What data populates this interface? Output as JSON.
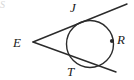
{
  "figure": {
    "kind": "geometry-diagram",
    "width": 134,
    "height": 80,
    "background_color": "#ffffff",
    "stroke_color": "#2b2b2b",
    "label_color": "#1a1a1a",
    "corner_mark": "S",
    "labels": {
      "external_point": "E",
      "upper_tangent_point": "J",
      "lower_tangent_point": "T",
      "circle_point": "R"
    },
    "geometry": {
      "circle": {
        "cx": 90,
        "cy": 44,
        "r": 23.5
      },
      "external_point": {
        "x": 33,
        "y": 42
      },
      "upper_tangent_point": {
        "x": 84,
        "y": 22
      },
      "lower_tangent_point": {
        "x": 79,
        "y": 66
      },
      "marked_point": {
        "x": 112,
        "y": 41
      },
      "upper_tangent_line": {
        "x1": 33,
        "y1": 42,
        "x2": 127,
        "y2": 4
      },
      "lower_tangent_line": {
        "x1": 33,
        "y1": 42,
        "x2": 116,
        "y2": 72
      }
    },
    "label_positions": {
      "E": {
        "x": 13,
        "y": 36
      },
      "J": {
        "x": 70,
        "y": 1
      },
      "T": {
        "x": 67,
        "y": 65
      },
      "R": {
        "x": 117,
        "y": 33
      }
    }
  }
}
